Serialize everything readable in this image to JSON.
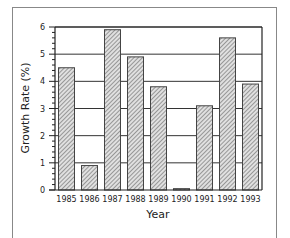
{
  "chart_data": {
    "type": "bar",
    "title": "",
    "xlabel": "Year",
    "ylabel": "Growth Rate (%)",
    "categories": [
      "1985",
      "1986",
      "1987",
      "1988",
      "1989",
      "1990",
      "1991",
      "1992",
      "1993"
    ],
    "values": [
      4.5,
      0.9,
      5.9,
      4.9,
      3.8,
      0.05,
      3.1,
      5.6,
      3.9
    ],
    "ylim": [
      0,
      6
    ],
    "yticks": [
      0,
      1,
      2,
      3,
      4,
      5,
      6
    ],
    "grid": true,
    "legend": null,
    "bar_fill": "hatched-gray"
  },
  "colors": {
    "bar_fill": "#c8c8c8",
    "bar_stroke": "#444444",
    "grid": "#333333",
    "frame": "#888888"
  }
}
